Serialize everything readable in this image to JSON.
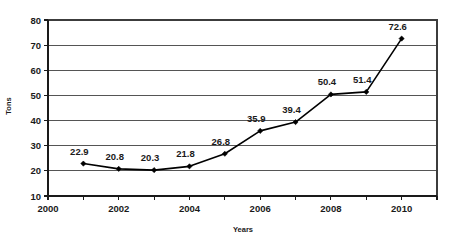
{
  "chart_data": {
    "type": "line",
    "title": "",
    "subtitle": "",
    "xlabel": "Years",
    "ylabel": "Tons",
    "x": [
      2001,
      2002,
      2003,
      2004,
      2005,
      2006,
      2007,
      2008,
      2009,
      2010
    ],
    "values": [
      22.9,
      20.8,
      20.3,
      21.8,
      26.8,
      35.9,
      39.4,
      50.4,
      51.4,
      72.6
    ],
    "point_labels": [
      "22.9",
      "20.8",
      "20.3",
      "21.8",
      "26.8",
      "35.9",
      "39.4",
      "50.4",
      "51.4",
      "72.6"
    ],
    "series": [
      {
        "name": "Tons",
        "values": [
          22.9,
          20.8,
          20.3,
          21.8,
          26.8,
          35.9,
          39.4,
          50.4,
          51.4,
          72.6
        ]
      }
    ],
    "xlim": [
      2000,
      2011
    ],
    "ylim": [
      10,
      80
    ],
    "ytick_labels": [
      "10",
      "20",
      "30",
      "40",
      "50",
      "60",
      "70",
      "80"
    ],
    "yticks": [
      10,
      20,
      30,
      40,
      50,
      60,
      70,
      80
    ],
    "xtick_labels": [
      "2000",
      "2002",
      "2004",
      "2006",
      "2008",
      "2010"
    ],
    "xticks": [
      2000,
      2002,
      2004,
      2006,
      2008,
      2010
    ],
    "x_minor_ticks": [
      2000,
      2001,
      2002,
      2003,
      2004,
      2005,
      2006,
      2007,
      2008,
      2009,
      2010,
      2011
    ],
    "grid": "horizontal",
    "legend": "none",
    "marker": "diamond",
    "line_color": "#000000",
    "marker_color": "#000000",
    "grid_color": "#555555",
    "background_color": "#ffffff",
    "text_color": "#1a1a1a"
  }
}
